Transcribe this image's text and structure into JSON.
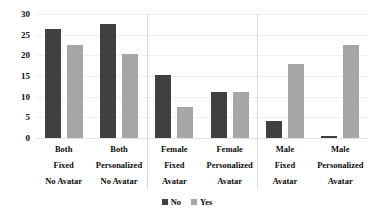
{
  "chart_data": {
    "type": "bar",
    "title": "",
    "subtitle": "",
    "xlabel": "",
    "ylabel": "",
    "ylim": [
      0,
      30
    ],
    "yticks": [
      0,
      5,
      10,
      15,
      20,
      25,
      30
    ],
    "ytick_labels": [
      "0",
      "5",
      "10",
      "15",
      "20",
      "25",
      "30"
    ],
    "grid": true,
    "legend_position": "bottom",
    "categories": [
      "Both Fixed No Avatar",
      "Both Personalized No Avatar",
      "Female Fixed Avatar",
      "Female Personalized Avatar",
      "Male Fixed Avatar",
      "Male Personalized Avatar"
    ],
    "category_lines": [
      [
        "Both",
        "Fixed",
        "No Avatar"
      ],
      [
        "Both",
        "Personalized",
        "No Avatar"
      ],
      [
        "Female",
        "Fixed",
        "Avatar"
      ],
      [
        "Female",
        "Personalized",
        "Avatar"
      ],
      [
        "Male",
        "Fixed",
        "Avatar"
      ],
      [
        "Male",
        "Personalized",
        "Avatar"
      ]
    ],
    "series": [
      {
        "name": "No",
        "color": "#404040",
        "values": [
          26.4,
          27.5,
          15.3,
          11.2,
          4.2,
          0.5
        ]
      },
      {
        "name": "Yes",
        "color": "#a6a6a6",
        "values": [
          22.6,
          20.3,
          7.4,
          11.2,
          17.9,
          22.4
        ]
      }
    ],
    "group_dividers_after": [
      2,
      4
    ]
  },
  "legend": {
    "items": [
      {
        "label": "No",
        "color": "#404040"
      },
      {
        "label": "Yes",
        "color": "#a6a6a6"
      }
    ]
  },
  "colors": {
    "series_no": "#404040",
    "series_yes": "#a6a6a6",
    "gridline": "#f1f1f1",
    "divider": "#d9d9d9",
    "text": "#0d0d0d",
    "background": "#ffffff"
  }
}
